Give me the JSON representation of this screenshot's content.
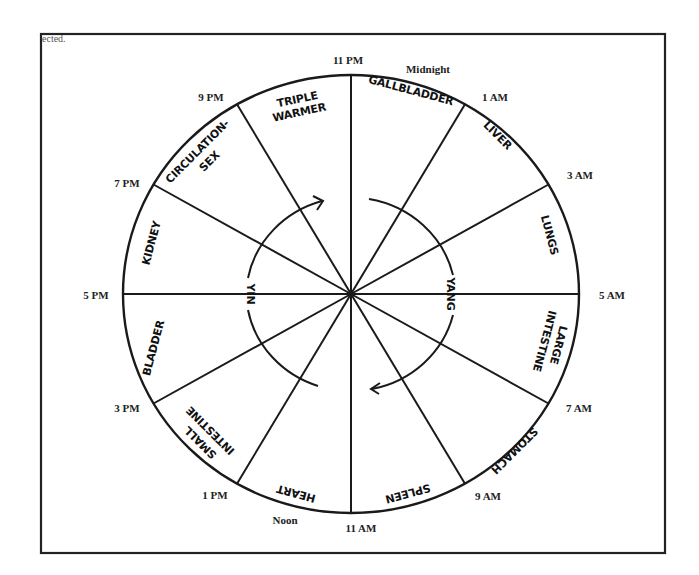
{
  "figure": {
    "clipped_caption_fragment": "ected.",
    "frame_color": "#222222",
    "line_color": "#1a1a1a"
  },
  "clock": {
    "center": "shared-hub",
    "time_labels": [
      {
        "id": "t11pm",
        "text": "11 PM"
      },
      {
        "id": "midnight",
        "text": "Midnight"
      },
      {
        "id": "t1am",
        "text": "1 AM"
      },
      {
        "id": "t3am",
        "text": "3  AM"
      },
      {
        "id": "t5am",
        "text": "5 AM"
      },
      {
        "id": "t7am",
        "text": "7 AM"
      },
      {
        "id": "t9am",
        "text": "9  AM"
      },
      {
        "id": "t11am",
        "text": "11 AM"
      },
      {
        "id": "noon",
        "text": "Noon"
      },
      {
        "id": "t1pm",
        "text": "1 PM"
      },
      {
        "id": "t3pm",
        "text": "3 PM"
      },
      {
        "id": "t5pm",
        "text": "5 PM"
      },
      {
        "id": "t7pm",
        "text": "7 PM"
      },
      {
        "id": "t9pm",
        "text": "9 PM"
      }
    ],
    "organs": [
      {
        "lines": [
          "GALLBLADDER"
        ],
        "from": "11 PM",
        "to": "1 AM"
      },
      {
        "lines": [
          "LIVER"
        ],
        "from": "1 AM",
        "to": "3 AM"
      },
      {
        "lines": [
          "LUNGS"
        ],
        "from": "3 AM",
        "to": "5 AM"
      },
      {
        "lines": [
          "LARGE",
          "INTESTINE"
        ],
        "from": "5 AM",
        "to": "7 AM"
      },
      {
        "lines": [
          "STOMACH"
        ],
        "from": "7 AM",
        "to": "9 AM"
      },
      {
        "lines": [
          "SPLEEN"
        ],
        "from": "9 AM",
        "to": "11 AM"
      },
      {
        "lines": [
          "HEART"
        ],
        "from": "11 AM",
        "to": "1 PM"
      },
      {
        "lines": [
          "SMALL",
          "INTESTINE"
        ],
        "from": "1 PM",
        "to": "3 PM"
      },
      {
        "lines": [
          "BLADDER"
        ],
        "from": "3 PM",
        "to": "5 PM"
      },
      {
        "lines": [
          "KIDNEY"
        ],
        "from": "5 PM",
        "to": "7 PM"
      },
      {
        "lines": [
          "CIRCULATION-",
          "SEX"
        ],
        "from": "7 PM",
        "to": "9 PM"
      },
      {
        "lines": [
          "TRIPLE",
          "WARMER"
        ],
        "from": "9 PM",
        "to": "11 PM"
      }
    ],
    "inner_labels": {
      "yin": "YIN",
      "yang": "YANG"
    }
  }
}
